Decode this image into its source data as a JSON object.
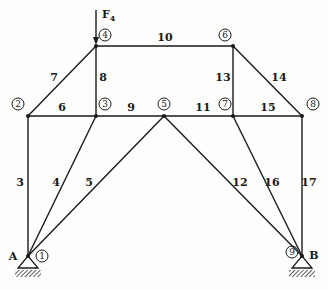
{
  "diagram": {
    "type": "truss",
    "force": {
      "label": "F",
      "subscript": "4",
      "node": 4
    },
    "nodes": [
      {
        "id": 1,
        "label": "1",
        "x": 28,
        "y": 256,
        "lx": 42,
        "ly": 259
      },
      {
        "id": 2,
        "label": "2",
        "x": 28,
        "y": 116,
        "lx": 18,
        "ly": 107
      },
      {
        "id": 3,
        "label": "3",
        "x": 96,
        "y": 116,
        "lx": 105,
        "ly": 107
      },
      {
        "id": 4,
        "label": "4",
        "x": 96,
        "y": 46,
        "lx": 105,
        "ly": 38
      },
      {
        "id": 5,
        "label": "5",
        "x": 164,
        "y": 116,
        "lx": 164,
        "ly": 107
      },
      {
        "id": 6,
        "label": "6",
        "x": 233,
        "y": 46,
        "lx": 225,
        "ly": 38
      },
      {
        "id": 7,
        "label": "7",
        "x": 233,
        "y": 116,
        "lx": 225,
        "ly": 107
      },
      {
        "id": 8,
        "label": "8",
        "x": 302,
        "y": 116,
        "lx": 313,
        "ly": 107
      },
      {
        "id": 9,
        "label": "9",
        "x": 302,
        "y": 256,
        "lx": 292,
        "ly": 255
      }
    ],
    "members": [
      {
        "id": "3",
        "from": 1,
        "to": 2,
        "lx": 20,
        "ly": 186
      },
      {
        "id": "4",
        "from": 1,
        "to": 3,
        "lx": 56,
        "ly": 186
      },
      {
        "id": "5",
        "from": 1,
        "to": 5,
        "lx": 89,
        "ly": 186
      },
      {
        "id": "6",
        "from": 2,
        "to": 3,
        "lx": 62,
        "ly": 111
      },
      {
        "id": "7",
        "from": 2,
        "to": 4,
        "lx": 54,
        "ly": 81
      },
      {
        "id": "8",
        "from": 3,
        "to": 4,
        "lx": 103,
        "ly": 81
      },
      {
        "id": "9",
        "from": 3,
        "to": 5,
        "lx": 131,
        "ly": 111
      },
      {
        "id": "10",
        "from": 4,
        "to": 6,
        "lx": 165,
        "ly": 41
      },
      {
        "id": "11",
        "from": 5,
        "to": 7,
        "lx": 203,
        "ly": 111
      },
      {
        "id": "12",
        "from": 5,
        "to": 9,
        "lx": 240,
        "ly": 186
      },
      {
        "id": "13",
        "from": 6,
        "to": 7,
        "lx": 223,
        "ly": 81
      },
      {
        "id": "14",
        "from": 6,
        "to": 8,
        "lx": 279,
        "ly": 81
      },
      {
        "id": "15",
        "from": 7,
        "to": 8,
        "lx": 268,
        "ly": 111
      },
      {
        "id": "16",
        "from": 7,
        "to": 9,
        "lx": 272,
        "ly": 186
      },
      {
        "id": "17",
        "from": 8,
        "to": 9,
        "lx": 309,
        "ly": 186
      }
    ],
    "supports": [
      {
        "label": "A",
        "node": 1,
        "lx": 13,
        "ly": 260
      },
      {
        "label": "B",
        "node": 9,
        "lx": 314,
        "ly": 259
      }
    ]
  }
}
